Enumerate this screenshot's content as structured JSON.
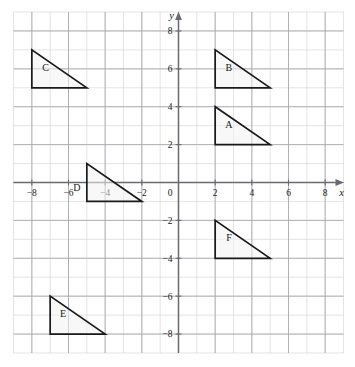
{
  "chart_data": {
    "type": "scatter",
    "title": "",
    "xlabel": "x",
    "ylabel": "y",
    "xlim": [
      -9,
      9
    ],
    "ylim": [
      -9,
      9
    ],
    "grid": true,
    "grid_major_step": 2,
    "grid_minor_step": 1,
    "origin_label": "0",
    "x_tick_labels": [
      "-8",
      "-6",
      "-4",
      "-2",
      "2",
      "4",
      "6",
      "8"
    ],
    "x_tick_values": [
      -8,
      -6,
      -4,
      -2,
      2,
      4,
      6,
      8
    ],
    "y_tick_labels": [
      "8",
      "6",
      "4",
      "2",
      "-2",
      "-4",
      "-6",
      "-8"
    ],
    "y_tick_values": [
      8,
      6,
      4,
      2,
      -2,
      -4,
      -6,
      -8
    ],
    "shapes": [
      {
        "label": "A",
        "type": "right-triangle",
        "vertices": [
          [
            2,
            4
          ],
          [
            2,
            2
          ],
          [
            5,
            2
          ]
        ],
        "label_pos": [
          2.75,
          2.9
        ]
      },
      {
        "label": "B",
        "type": "right-triangle",
        "vertices": [
          [
            2,
            7
          ],
          [
            2,
            5
          ],
          [
            5,
            5
          ]
        ],
        "label_pos": [
          2.75,
          5.9
        ]
      },
      {
        "label": "C",
        "type": "right-triangle",
        "vertices": [
          [
            -8,
            7
          ],
          [
            -8,
            5
          ],
          [
            -5,
            5
          ]
        ],
        "label_pos": [
          -7.25,
          5.9
        ]
      },
      {
        "label": "D",
        "type": "right-triangle",
        "vertices": [
          [
            -5,
            1
          ],
          [
            -5,
            -1
          ],
          [
            -2,
            -1
          ]
        ],
        "label_pos": [
          -5.55,
          -0.45
        ]
      },
      {
        "label": "E",
        "type": "right-triangle",
        "vertices": [
          [
            -7,
            -6
          ],
          [
            -7,
            -8
          ],
          [
            -4,
            -8
          ]
        ],
        "label_pos": [
          -6.3,
          -7.1
        ]
      },
      {
        "label": "F",
        "type": "right-triangle",
        "vertices": [
          [
            2,
            -2
          ],
          [
            2,
            -4
          ],
          [
            5,
            -4
          ]
        ],
        "label_pos": [
          2.75,
          -3.1
        ]
      }
    ]
  },
  "style": {
    "background": "#ffffff",
    "grid_minor_color": "#d8d8dc",
    "grid_major_color": "#a9a9b0",
    "axis_color": "#6a6a72",
    "shape_stroke": "#1a1a1a",
    "shape_fill": "#f2f2f2",
    "text_color": "#1a1a1a"
  }
}
